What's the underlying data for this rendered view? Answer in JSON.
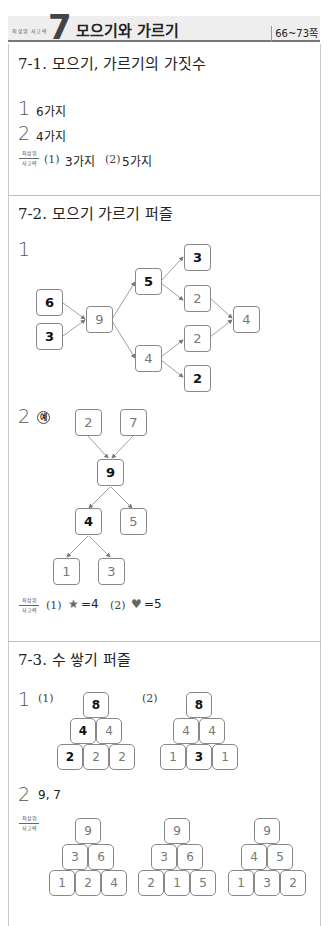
{
  "header": {
    "small_label": "최상위 사고력",
    "chapter_number": "7",
    "title": "모으기와 가르기",
    "pages": "66~73쪽"
  },
  "section1": {
    "title": "7-1. 모으기, 가르기의 가짓수",
    "q1": {
      "num": "1",
      "answer": "6가지"
    },
    "q2": {
      "num": "2",
      "answer": "4가지"
    },
    "extra": {
      "tag_top": "최상위",
      "tag_bottom": "사고력",
      "p1_label": "(1)",
      "p1_answer": "3가지",
      "p2_label": "(2)",
      "p2_answer": "5가지"
    }
  },
  "section2": {
    "title": "7-2. 모으기 가르기 퍼즐",
    "q1": {
      "num": "1",
      "nodes": {
        "a": "6",
        "b": "3",
        "c": "9",
        "d": "5",
        "e": "4",
        "f": "3",
        "g": "2",
        "h": "2",
        "i": "2",
        "j": "4"
      }
    },
    "q2": {
      "num": "2",
      "example": "예",
      "nodes": {
        "a": "2",
        "b": "7",
        "c": "9",
        "d": "4",
        "e": "5",
        "f": "1",
        "g": "3"
      }
    },
    "extra": {
      "tag_top": "최상위",
      "tag_bottom": "사고력",
      "p1_label": "(1)",
      "p1_symbol": "★",
      "p1_answer": "=4",
      "p2_label": "(2)",
      "p2_symbol": "♥",
      "p2_answer": "=5"
    }
  },
  "section3": {
    "title": "7-3. 수 쌓기 퍼즐",
    "q1": {
      "num": "1",
      "p1_label": "(1)",
      "p1": {
        "top": "8",
        "mid": [
          "4",
          "4"
        ],
        "bottom": [
          "2",
          "2",
          "2"
        ]
      },
      "p2_label": "(2)",
      "p2": {
        "top": "8",
        "mid": [
          "4",
          "4"
        ],
        "bottom": [
          "1",
          "3",
          "1"
        ]
      }
    },
    "q2": {
      "num": "2",
      "answer": "9, 7",
      "tag_top": "최상위",
      "tag_bottom": "사고력",
      "pyramids": [
        {
          "top": "9",
          "mid": [
            "3",
            "6"
          ],
          "bottom": [
            "1",
            "2",
            "4"
          ]
        },
        {
          "top": "9",
          "mid": [
            "3",
            "6"
          ],
          "bottom": [
            "2",
            "1",
            "5"
          ]
        },
        {
          "top": "9",
          "mid": [
            "4",
            "5"
          ],
          "bottom": [
            "1",
            "3",
            "2"
          ]
        }
      ]
    }
  }
}
